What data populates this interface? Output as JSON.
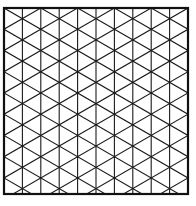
{
  "diagram": {
    "type": "isometric-triangle-grid",
    "background": "#ffffff",
    "line_color": "#1a1a1a",
    "frame_color": "#111111",
    "frame": {
      "x": 4,
      "y": 8,
      "width": 184,
      "height": 186,
      "stroke_width": 2.2
    },
    "columns": 10,
    "grid_stroke_width": 1.1,
    "diagonal_angle_deg": 30
  }
}
